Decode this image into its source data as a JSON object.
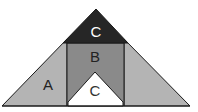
{
  "diagram": {
    "type": "geometric-decomposition",
    "regions": [
      {
        "id": "A",
        "label": "A",
        "description": "left and right side triangles",
        "color": "#b4b4b4"
      },
      {
        "id": "B",
        "label": "B",
        "description": "central vertical band",
        "color": "#8a8a8a"
      },
      {
        "id": "C-top",
        "label": "C",
        "description": "top dark triangle",
        "color": "#262626",
        "label_color": "#ffffff"
      },
      {
        "id": "C-bottom",
        "label": "C",
        "description": "bottom white triangle",
        "color": "#ffffff",
        "label_color": "#333333"
      }
    ],
    "stroke_color": "#1a1a1a"
  }
}
